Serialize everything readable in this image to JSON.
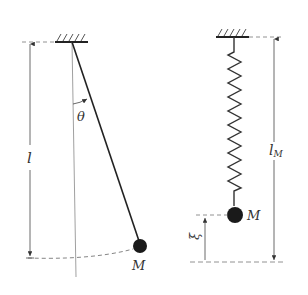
{
  "colors": {
    "ink": "#222222",
    "light": "#777777",
    "bob": "#1a1a1a"
  },
  "pendulum": {
    "length_label": "l",
    "angle_label": "θ",
    "mass_label": "M"
  },
  "spring_pendulum": {
    "length_label": "l",
    "length_subscript": "M",
    "displacement_label": "ξ",
    "mass_label": "M"
  }
}
